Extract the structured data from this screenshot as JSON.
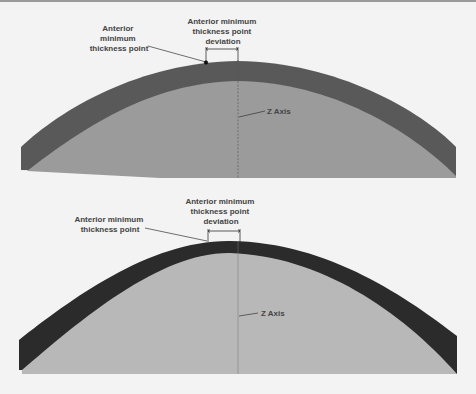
{
  "figures": [
    {
      "name": "upper-lens",
      "labels": {
        "min_point": [
          "Anterior",
          "minimum",
          "thickness point"
        ],
        "deviation": [
          "Anterior minimum",
          "thickness point",
          "deviation"
        ],
        "z_axis": "Z Axis"
      }
    },
    {
      "name": "lower-lens",
      "labels": {
        "min_point": [
          "Anterior minimum",
          "thickness point"
        ],
        "deviation": [
          "Anterior minimum",
          "thickness point",
          "deviation"
        ],
        "z_axis": "Z Axis"
      }
    }
  ],
  "colors": {
    "background": "#f3f3f3",
    "upper_shell": "#595959",
    "upper_inner": "#9b9b9b",
    "lower_shell": "#2b2b2b",
    "lower_inner": "#b8b8b8",
    "label": "#444444"
  }
}
